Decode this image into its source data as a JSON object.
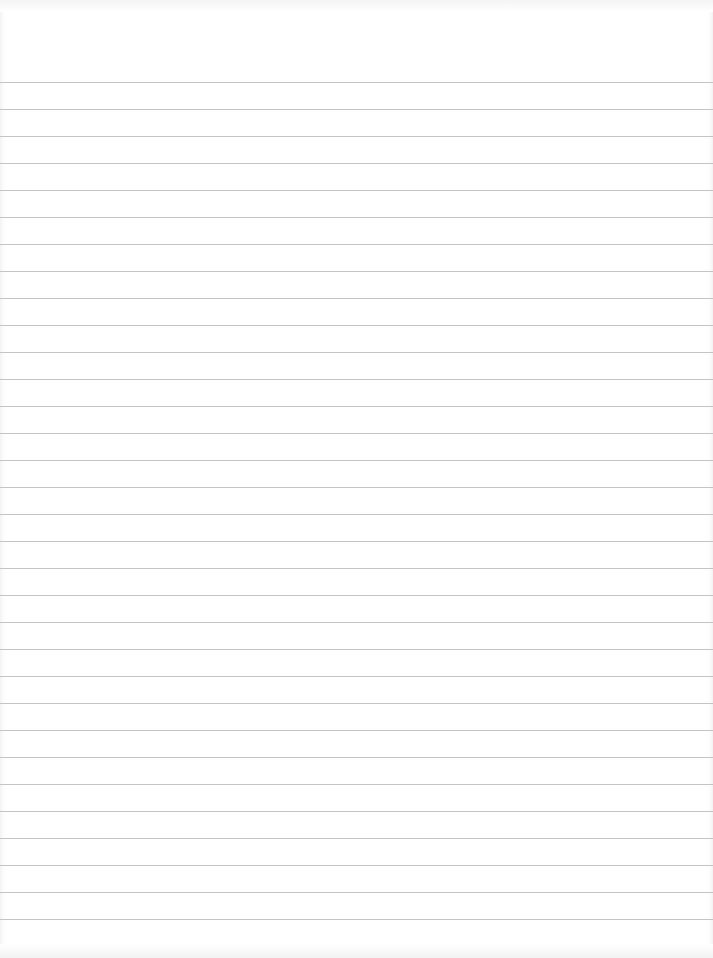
{
  "paper": {
    "type": "lined-paper",
    "background_color": "#ffffff",
    "rule_color": "#c4c4c4",
    "first_rule_y": 82,
    "rule_spacing": 27,
    "rule_count": 32
  }
}
